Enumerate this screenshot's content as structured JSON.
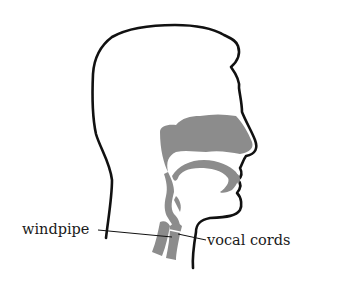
{
  "diagram": {
    "title": "",
    "colors": {
      "outline": "#111111",
      "tract_fill": "#8c8c8c",
      "background": "#ffffff",
      "label_text": "#1a1a1a"
    },
    "labels": {
      "windpipe": "windpipe",
      "vocal_cords": "vocal cords"
    }
  }
}
